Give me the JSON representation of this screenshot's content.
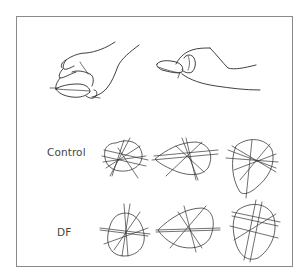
{
  "figure": {
    "panels": {
      "top": {
        "left_drawing": "hand-grasping-object-from-above",
        "right_drawing": "hand-pinch-grasping-object"
      },
      "bottom": {
        "rows": [
          {
            "label": "Control",
            "diagram_count": 3
          },
          {
            "label": "DF",
            "diagram_count": 3
          }
        ]
      }
    },
    "colors": {
      "ink": "#2a2a2a",
      "border": "#8a8a8a",
      "label": "#444444",
      "background": "#ffffff"
    }
  }
}
